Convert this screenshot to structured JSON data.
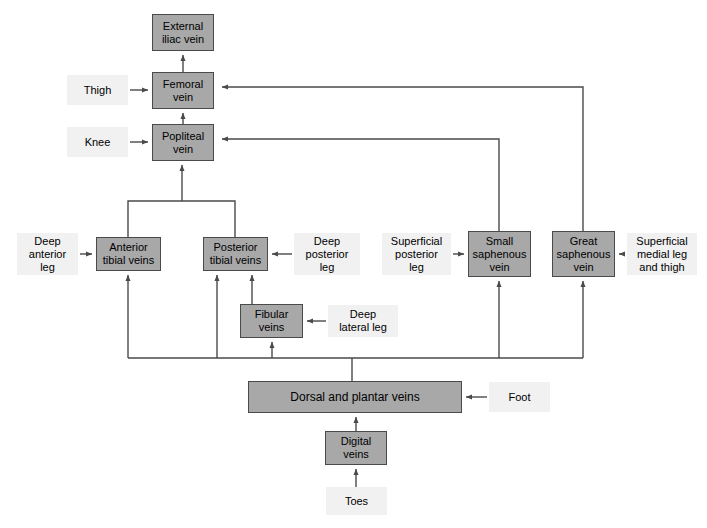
{
  "diagram": {
    "type": "flow-diagram",
    "colors": {
      "node_fill": "#a8a8a8",
      "node_border": "#4a4a4a",
      "label_fill": "#f1f1f1",
      "wire": "#4a4a4a",
      "background": "#ffffff",
      "text": "#000000"
    }
  },
  "nodes": [
    {
      "id": "external-iliac-vein",
      "label": "External\niliac vein",
      "x": 152,
      "y": 14,
      "w": 62,
      "h": 37
    },
    {
      "id": "femoral-vein",
      "label": "Femoral\nvein",
      "x": 152,
      "y": 72,
      "w": 62,
      "h": 37
    },
    {
      "id": "popliteal-vein",
      "label": "Popliteal\nvein",
      "x": 152,
      "y": 124,
      "w": 62,
      "h": 37
    },
    {
      "id": "anterior-tibial-veins",
      "label": "Anterior\ntibial veins",
      "x": 96,
      "y": 237,
      "w": 65,
      "h": 34
    },
    {
      "id": "posterior-tibial-veins",
      "label": "Posterior\ntibial veins",
      "x": 203,
      "y": 237,
      "w": 65,
      "h": 34
    },
    {
      "id": "small-saphenous-vein",
      "label": "Small\nsaphenous\nvein",
      "x": 468,
      "y": 231,
      "w": 63,
      "h": 46
    },
    {
      "id": "great-saphenous-vein",
      "label": "Great\nsaphenous\nvein",
      "x": 552,
      "y": 231,
      "w": 63,
      "h": 46
    },
    {
      "id": "fibular-veins",
      "label": "Fibular\nveins",
      "x": 240,
      "y": 304,
      "w": 63,
      "h": 34
    },
    {
      "id": "dorsal-and-plantar-veins",
      "label": "Dorsal and plantar veins",
      "x": 248,
      "y": 381,
      "w": 214,
      "h": 32,
      "wide": true
    },
    {
      "id": "digital-veins",
      "label": "Digital\nveins",
      "x": 325,
      "y": 431,
      "w": 62,
      "h": 34
    }
  ],
  "source_labels": [
    {
      "id": "thigh",
      "label": "Thigh",
      "x": 67,
      "y": 75,
      "w": 61,
      "h": 30
    },
    {
      "id": "knee",
      "label": "Knee",
      "x": 67,
      "y": 127,
      "w": 61,
      "h": 30
    },
    {
      "id": "deep-anterior-leg",
      "label": "Deep\nanterior\nleg",
      "x": 17,
      "y": 233,
      "w": 61,
      "h": 42
    },
    {
      "id": "deep-posterior-leg",
      "label": "Deep\nposterior\nleg",
      "x": 294,
      "y": 233,
      "w": 66,
      "h": 42
    },
    {
      "id": "superficial-posterior-leg",
      "label": "Superficial\nposterior\nleg",
      "x": 382,
      "y": 233,
      "w": 69,
      "h": 42
    },
    {
      "id": "superficial-medial-leg-and-thigh",
      "label": "Superficial\nmedial leg\nand thigh",
      "x": 627,
      "y": 233,
      "w": 70,
      "h": 42
    },
    {
      "id": "deep-lateral-leg",
      "label": "Deep\nlateral leg",
      "x": 328,
      "y": 305,
      "w": 70,
      "h": 32
    },
    {
      "id": "foot",
      "label": "Foot",
      "x": 489,
      "y": 382,
      "w": 61,
      "h": 30
    },
    {
      "id": "toes",
      "label": "Toes",
      "x": 326,
      "y": 487,
      "w": 61,
      "h": 28
    }
  ],
  "connections": [
    {
      "id": "femoral-to-external-iliac",
      "from": "femoral-vein",
      "to": "external-iliac-vein",
      "kind": "arrow-up"
    },
    {
      "id": "popliteal-to-femoral",
      "from": "popliteal-vein",
      "to": "femoral-vein",
      "kind": "arrow-up"
    },
    {
      "id": "tibial-junction-to-popliteal",
      "from": "anterior-and-posterior-tibial-veins",
      "to": "popliteal-vein",
      "kind": "merge-up"
    },
    {
      "id": "dorsal-bus-to-anterior-tibial",
      "from": "dorsal-and-plantar-veins",
      "to": "anterior-tibial-veins",
      "kind": "bus-up"
    },
    {
      "id": "dorsal-bus-to-posterior-tibial",
      "from": "dorsal-and-plantar-veins",
      "to": "posterior-tibial-veins",
      "kind": "bus-up"
    },
    {
      "id": "dorsal-bus-to-fibular",
      "from": "dorsal-and-plantar-veins",
      "to": "fibular-veins",
      "kind": "bus-up"
    },
    {
      "id": "fibular-to-posterior-tibial",
      "from": "fibular-veins",
      "to": "posterior-tibial-veins",
      "kind": "arrow-up"
    },
    {
      "id": "dorsal-bus-to-small-saphenous",
      "from": "dorsal-and-plantar-veins",
      "to": "small-saphenous-vein",
      "kind": "bus-up"
    },
    {
      "id": "dorsal-bus-to-great-saphenous",
      "from": "dorsal-and-plantar-veins",
      "to": "great-saphenous-vein",
      "kind": "bus-up"
    },
    {
      "id": "small-saphenous-to-popliteal",
      "from": "small-saphenous-vein",
      "to": "popliteal-vein",
      "kind": "route-up-left"
    },
    {
      "id": "great-saphenous-to-femoral",
      "from": "great-saphenous-vein",
      "to": "femoral-vein",
      "kind": "route-up-left"
    },
    {
      "id": "digital-to-dorsal",
      "from": "digital-veins",
      "to": "dorsal-and-plantar-veins",
      "kind": "arrow-up"
    },
    {
      "id": "thigh-to-femoral",
      "from": "thigh",
      "to": "femoral-vein",
      "kind": "arrow-right"
    },
    {
      "id": "knee-to-popliteal",
      "from": "knee",
      "to": "popliteal-vein",
      "kind": "arrow-right"
    },
    {
      "id": "deep-anterior-leg-to-anterior-tibial",
      "from": "deep-anterior-leg",
      "to": "anterior-tibial-veins",
      "kind": "arrow-right"
    },
    {
      "id": "deep-posterior-leg-to-posterior-tibial",
      "from": "deep-posterior-leg",
      "to": "posterior-tibial-veins",
      "kind": "arrow-left"
    },
    {
      "id": "superficial-posterior-leg-to-small-saphenous",
      "from": "superficial-posterior-leg",
      "to": "small-saphenous-vein",
      "kind": "arrow-right"
    },
    {
      "id": "superficial-medial-to-great-saphenous",
      "from": "superficial-medial-leg-and-thigh",
      "to": "great-saphenous-vein",
      "kind": "arrow-left"
    },
    {
      "id": "deep-lateral-leg-to-fibular",
      "from": "deep-lateral-leg",
      "to": "fibular-veins",
      "kind": "arrow-left"
    },
    {
      "id": "foot-to-dorsal",
      "from": "foot",
      "to": "dorsal-and-plantar-veins",
      "kind": "arrow-left"
    },
    {
      "id": "toes-to-digital",
      "from": "toes",
      "to": "digital-veins",
      "kind": "arrow-up"
    }
  ]
}
